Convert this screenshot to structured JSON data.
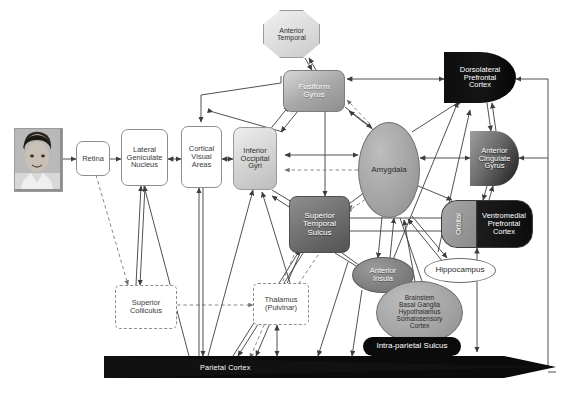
{
  "nodes": [
    {
      "id": "photo",
      "label": "",
      "kind": "face-photo"
    },
    {
      "id": "retina",
      "label": "Retina",
      "style": "white"
    },
    {
      "id": "lgn",
      "label": "Lateral Geniculate Nucleus",
      "style": "white"
    },
    {
      "id": "cva",
      "label": "Cortical Visual Areas",
      "style": "white"
    },
    {
      "id": "iog",
      "label": "Inferior Occipital Gyri",
      "style": "gray-light"
    },
    {
      "id": "fusiform",
      "label": "Fusiform Gyrus",
      "style": "gray-mid"
    },
    {
      "id": "anterior_temporal",
      "label": "Anterior Temporal",
      "style": "octagon"
    },
    {
      "id": "sts",
      "label": "Superior Temporal Sulcus",
      "style": "gray-dark"
    },
    {
      "id": "amygdala",
      "label": "Amygdala",
      "style": "ellipse-gray"
    },
    {
      "id": "dlpfc",
      "label": "Dorsolateral Prefrontal Cortex",
      "style": "dome-black"
    },
    {
      "id": "acg",
      "label": "Anterior Cingulate Gyrus",
      "style": "dome-gray"
    },
    {
      "id": "orbital",
      "label": "Orbital",
      "style": "pill-gray-segment"
    },
    {
      "id": "vmpfc",
      "label": "Ventromedial Prefrontal Cortex",
      "style": "pill-black"
    },
    {
      "id": "anterior_insula",
      "label": "Anterior Insula",
      "style": "ellipse-dark"
    },
    {
      "id": "hippocampus",
      "label": "Hippocampus",
      "style": "ellipse-white"
    },
    {
      "id": "brainstem",
      "label": "Brainstem Basal Ganglia Hypothalamus Somatosensory Cortex",
      "style": "ellipse-gray"
    },
    {
      "id": "ips",
      "label": "Intra-parietal Sulcus",
      "style": "black-pill"
    },
    {
      "id": "superior_colliculus",
      "label": "Superior Colliculus",
      "style": "dashed"
    },
    {
      "id": "thalamus",
      "label": "Thalamus (Pulvinar)",
      "style": "dashed"
    },
    {
      "id": "parietal",
      "label": "Parietal Cortex",
      "style": "black-wedge"
    }
  ],
  "node_labels": {
    "retina": "Retina",
    "lgn_line1": "Lateral",
    "lgn_line2": "Geniculate",
    "lgn_line3": "Nucleus",
    "cva_line1": "Cortical",
    "cva_line2": "Visual",
    "cva_line3": "Areas",
    "iog_line1": "Inferior",
    "iog_line2": "Occipital",
    "iog_line3": "Gyri",
    "fusiform_line1": "Fusiform",
    "fusiform_line2": "Gyrus",
    "anterior_temporal_line1": "Anterior",
    "anterior_temporal_line2": "Temporal",
    "sts_line1": "Superior",
    "sts_line2": "Temporal",
    "sts_line3": "Sulcus",
    "amygdala": "Amygdala",
    "dlpfc_line1": "Dorsolateral",
    "dlpfc_line2": "Prefrontal",
    "dlpfc_line3": "Cortex",
    "acg_line1": "Anterior",
    "acg_line2": "Cingulate",
    "acg_line3": "Gyrus",
    "orbital": "Orbital",
    "vmpfc_line1": "Ventromedial",
    "vmpfc_line2": "Prefrontal",
    "vmpfc_line3": "Cortex",
    "anterior_insula_line1": "Anterior",
    "anterior_insula_line2": "Insula",
    "hippocampus": "Hippocampus",
    "brainstem_line1": "Brainstem",
    "brainstem_line2": "Basal Ganglia",
    "brainstem_line3": "Hypothalamus",
    "brainstem_line4": "Somatosensory",
    "brainstem_line5": "Cortex",
    "ips": "Intra-parietal Sulcus",
    "superior_colliculus_line1": "Superior",
    "superior_colliculus_line2": "Colliculus",
    "thalamus_line1": "Thalamus",
    "thalamus_line2": "(Pulvinar)",
    "parietal": "Parietal Cortex"
  },
  "colors": {
    "background": "#ffffff",
    "stroke": "#4a4a4a",
    "black_fill": "#0a0a0a",
    "gray_light": "#d2d2d2",
    "gray_mid": "#a9a9a9",
    "gray_dark": "#6d6d6d",
    "dashed_stroke": "#8d8d8d",
    "text_light": "#ffffff",
    "text_dark": "#2f2f2f"
  },
  "edge_legend": {
    "solid": "established connection",
    "dashed": "putative / subcortical connection"
  }
}
